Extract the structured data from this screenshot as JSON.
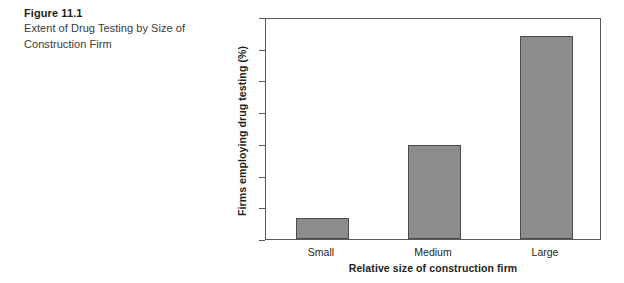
{
  "caption": {
    "title": "Figure 11.1",
    "description": "Extent of Drug Testing by Size of Construction Firm"
  },
  "chart_data": {
    "type": "bar",
    "title": "",
    "categories": [
      "Small",
      "Medium",
      "Large"
    ],
    "values": [
      6.5,
      29.5,
      64
    ],
    "xlabel": "Relative size of construction firm",
    "ylabel": "Firms employing drug testing (%)",
    "ylim": [
      0,
      70
    ],
    "yticks": [
      70,
      60,
      50,
      40,
      30,
      20,
      10,
      0
    ],
    "ytick_labels": [
      "70",
      "60",
      "50",
      "40",
      "30",
      "20",
      "10",
      "0"
    ],
    "grid": false,
    "legend": false,
    "bar_color": "#8c8c8c",
    "bar_edge_color": "#4d4d4d",
    "axis_color": "#58595b"
  }
}
